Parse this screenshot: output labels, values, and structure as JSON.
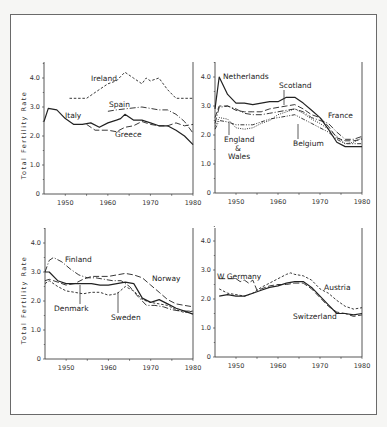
{
  "chart_data": [
    {
      "type": "line",
      "panel": "top-left",
      "ylabel": "Total Fertility Rate",
      "xlim": [
        1945,
        1980
      ],
      "ylim": [
        0,
        4.5
      ],
      "xticks": [
        "1950",
        "1960",
        "1970",
        "1980"
      ],
      "yticks": [
        "0",
        "1.0",
        "2.0",
        "3.0",
        "4.0"
      ],
      "series": [
        {
          "name": "Ireland",
          "style": "dashed-short",
          "x": [
            1951,
            1955,
            1958,
            1960,
            1962,
            1964,
            1966,
            1968,
            1969,
            1970,
            1972,
            1974,
            1976,
            1978,
            1980
          ],
          "values": [
            3.3,
            3.3,
            3.6,
            3.8,
            3.9,
            4.2,
            4.0,
            3.8,
            4.0,
            3.9,
            4.0,
            3.6,
            3.3,
            3.3,
            3.3
          ]
        },
        {
          "name": "Spain",
          "style": "dash-dot",
          "x": [
            1960,
            1962,
            1965,
            1968,
            1970,
            1972,
            1974,
            1976,
            1978,
            1980
          ],
          "values": [
            2.85,
            2.9,
            2.95,
            3.0,
            2.95,
            2.9,
            2.9,
            2.75,
            2.5,
            2.1
          ]
        },
        {
          "name": "Italy",
          "style": "solid",
          "x": [
            1945,
            1946,
            1948,
            1950,
            1952,
            1954,
            1956,
            1958,
            1960,
            1962,
            1963,
            1964,
            1966,
            1968,
            1970,
            1972,
            1974,
            1976,
            1978,
            1980
          ],
          "values": [
            2.5,
            2.95,
            2.9,
            2.6,
            2.4,
            2.4,
            2.45,
            2.3,
            2.45,
            2.55,
            2.6,
            2.75,
            2.55,
            2.55,
            2.45,
            2.35,
            2.35,
            2.2,
            2.0,
            1.7
          ]
        },
        {
          "name": "Greece",
          "style": "dashed-long",
          "x": [
            1955,
            1957,
            1960,
            1962,
            1964,
            1966,
            1968,
            1970,
            1972,
            1974,
            1976,
            1978,
            1980
          ],
          "values": [
            2.4,
            2.2,
            2.2,
            2.15,
            2.3,
            2.35,
            2.5,
            2.4,
            2.35,
            2.35,
            2.45,
            2.35,
            2.4
          ]
        }
      ],
      "annotations": [
        "Ireland",
        "Spain",
        "Italy",
        "Greece"
      ]
    },
    {
      "type": "line",
      "panel": "top-right",
      "xlim": [
        1945,
        1980
      ],
      "ylim": [
        0,
        4.5
      ],
      "xticks": [
        "1950",
        "1960",
        "1970",
        "1980"
      ],
      "yticks": [
        "0",
        "1.0",
        "2.0",
        "3.0",
        "4.0"
      ],
      "series": [
        {
          "name": "Netherlands",
          "style": "solid",
          "x": [
            1945,
            1946,
            1948,
            1950,
            1952,
            1954,
            1956,
            1958,
            1960,
            1962,
            1964,
            1966,
            1968,
            1970,
            1972,
            1974,
            1976,
            1978,
            1980
          ],
          "values": [
            2.9,
            4.0,
            3.4,
            3.1,
            3.1,
            3.05,
            3.1,
            3.15,
            3.15,
            3.3,
            3.3,
            3.1,
            2.85,
            2.6,
            2.2,
            1.75,
            1.6,
            1.6,
            1.6
          ]
        },
        {
          "name": "Scotland",
          "style": "dashed-long",
          "x": [
            1945,
            1946,
            1948,
            1950,
            1952,
            1954,
            1956,
            1958,
            1960,
            1962,
            1964,
            1966,
            1968,
            1970,
            1972,
            1974,
            1976,
            1978,
            1980
          ],
          "values": [
            2.6,
            3.0,
            3.0,
            2.85,
            2.8,
            2.8,
            2.8,
            2.9,
            2.95,
            3.0,
            3.05,
            2.9,
            2.7,
            2.6,
            2.3,
            1.9,
            1.8,
            1.8,
            1.85
          ]
        },
        {
          "name": "France",
          "style": "dash-dot",
          "x": [
            1945,
            1946,
            1948,
            1950,
            1952,
            1954,
            1956,
            1958,
            1960,
            1962,
            1964,
            1966,
            1968,
            1970,
            1972,
            1974,
            1976,
            1978,
            1980
          ],
          "values": [
            2.4,
            2.95,
            3.0,
            2.9,
            2.75,
            2.7,
            2.7,
            2.75,
            2.8,
            2.85,
            2.9,
            2.8,
            2.6,
            2.5,
            2.4,
            2.1,
            1.85,
            1.85,
            1.95
          ]
        },
        {
          "name": "England & Wales",
          "style": "dotted",
          "x": [
            1945,
            1946,
            1948,
            1950,
            1952,
            1954,
            1956,
            1958,
            1960,
            1962,
            1964,
            1966,
            1968,
            1970,
            1972,
            1974,
            1976,
            1978,
            1980
          ],
          "values": [
            2.3,
            2.6,
            2.55,
            2.25,
            2.2,
            2.25,
            2.4,
            2.5,
            2.7,
            2.8,
            2.9,
            2.75,
            2.55,
            2.4,
            2.2,
            1.95,
            1.7,
            1.75,
            1.9
          ]
        },
        {
          "name": "Belgium",
          "style": "dash-dot-dot",
          "x": [
            1945,
            1946,
            1948,
            1950,
            1952,
            1954,
            1956,
            1958,
            1960,
            1962,
            1964,
            1966,
            1968,
            1970,
            1972,
            1974,
            1976,
            1978,
            1980
          ],
          "values": [
            2.2,
            2.5,
            2.45,
            2.35,
            2.35,
            2.35,
            2.45,
            2.55,
            2.6,
            2.65,
            2.7,
            2.55,
            2.4,
            2.25,
            2.1,
            1.85,
            1.7,
            1.7,
            1.7
          ]
        }
      ],
      "annotations": [
        "Netherlands",
        "Scotland",
        "France",
        "England",
        "&",
        "Wales",
        "Belgium"
      ]
    },
    {
      "type": "line",
      "panel": "bottom-left",
      "ylabel": "Total Fertility Rate",
      "xlim": [
        1945,
        1980
      ],
      "ylim": [
        0,
        4.5
      ],
      "xticks": [
        "1950",
        "1960",
        "1970",
        "1980"
      ],
      "yticks": [
        "0",
        "1.0",
        "2.0",
        "3.0",
        "4.0"
      ],
      "series": [
        {
          "name": "Finland",
          "style": "dash-dot",
          "x": [
            1945,
            1946,
            1947,
            1949,
            1951,
            1953,
            1955,
            1957,
            1959,
            1961,
            1963,
            1965,
            1967,
            1969,
            1971,
            1973,
            1975,
            1977,
            1980
          ],
          "values": [
            3.0,
            3.4,
            3.5,
            3.35,
            3.1,
            2.9,
            2.8,
            2.8,
            2.75,
            2.7,
            2.7,
            2.5,
            2.15,
            1.85,
            1.85,
            1.8,
            1.7,
            1.65,
            1.65
          ]
        },
        {
          "name": "Norway",
          "style": "dashed-long",
          "x": [
            1945,
            1946,
            1948,
            1950,
            1952,
            1954,
            1956,
            1958,
            1960,
            1962,
            1964,
            1966,
            1968,
            1970,
            1972,
            1974,
            1976,
            1978,
            1980
          ],
          "values": [
            2.7,
            2.75,
            2.65,
            2.55,
            2.6,
            2.75,
            2.85,
            2.85,
            2.85,
            2.9,
            2.95,
            2.9,
            2.8,
            2.55,
            2.3,
            2.05,
            1.9,
            1.85,
            1.8
          ]
        },
        {
          "name": "Denmark",
          "style": "solid",
          "x": [
            1945,
            1946,
            1948,
            1950,
            1952,
            1954,
            1956,
            1958,
            1960,
            1962,
            1964,
            1966,
            1968,
            1970,
            1972,
            1974,
            1976,
            1978,
            1980
          ],
          "values": [
            3.0,
            3.0,
            2.7,
            2.6,
            2.6,
            2.6,
            2.6,
            2.55,
            2.55,
            2.6,
            2.65,
            2.6,
            2.1,
            1.95,
            2.05,
            1.9,
            1.75,
            1.65,
            1.55
          ]
        },
        {
          "name": "Sweden",
          "style": "dashed-short",
          "x": [
            1945,
            1946,
            1948,
            1950,
            1952,
            1954,
            1956,
            1958,
            1960,
            1962,
            1964,
            1966,
            1968,
            1970,
            1972,
            1974,
            1976,
            1978,
            1980
          ],
          "values": [
            2.6,
            2.7,
            2.5,
            2.35,
            2.3,
            2.25,
            2.3,
            2.3,
            2.2,
            2.25,
            2.5,
            2.35,
            2.05,
            1.95,
            1.9,
            1.85,
            1.7,
            1.6,
            1.65
          ]
        }
      ],
      "annotations": [
        "Finland",
        "Norway",
        "Denmark",
        "Sweden"
      ]
    },
    {
      "type": "line",
      "panel": "bottom-right",
      "xlim": [
        1945,
        1980
      ],
      "ylim": [
        0,
        4.5
      ],
      "xticks": [
        "1950",
        "1960",
        "1970",
        "1980"
      ],
      "yticks": [
        "0",
        "1.0",
        "2.0",
        "3.0",
        "4.0"
      ],
      "series": [
        {
          "name": "W Germany",
          "style": "dashed-long",
          "x": [
            1946,
            1948,
            1950,
            1951,
            1952,
            1953,
            1954,
            1955,
            1956,
            1958,
            1960,
            1962,
            1964,
            1966,
            1968,
            1970,
            1972,
            1974,
            1976,
            1978,
            1980
          ],
          "values": [
            2.7,
            2.7,
            2.7,
            2.6,
            2.65,
            2.55,
            2.65,
            2.3,
            2.35,
            2.45,
            2.5,
            2.5,
            2.55,
            2.55,
            2.35,
            2.05,
            1.75,
            1.55,
            1.5,
            1.4,
            1.45
          ]
        },
        {
          "name": "Austria",
          "style": "dashed-short",
          "x": [
            1946,
            1948,
            1950,
            1952,
            1954,
            1956,
            1958,
            1960,
            1962,
            1963,
            1964,
            1966,
            1968,
            1970,
            1972,
            1974,
            1976,
            1978,
            1980
          ],
          "values": [
            2.35,
            2.2,
            2.15,
            2.1,
            2.2,
            2.4,
            2.55,
            2.7,
            2.85,
            2.9,
            2.85,
            2.8,
            2.65,
            2.35,
            2.2,
            1.95,
            1.75,
            1.65,
            1.7
          ]
        },
        {
          "name": "Switzerland",
          "style": "solid",
          "x": [
            1946,
            1948,
            1950,
            1952,
            1954,
            1956,
            1958,
            1960,
            1962,
            1964,
            1966,
            1968,
            1970,
            1972,
            1974,
            1976,
            1978,
            1980
          ],
          "values": [
            2.1,
            2.15,
            2.1,
            2.1,
            2.2,
            2.3,
            2.4,
            2.45,
            2.55,
            2.6,
            2.6,
            2.4,
            2.1,
            1.8,
            1.5,
            1.5,
            1.45,
            1.5
          ]
        }
      ],
      "annotations": [
        "W Germany",
        "Austria",
        "Switzerland"
      ]
    }
  ],
  "labels": {
    "ireland": "Ireland",
    "spain": "Spain",
    "italy": "Italy",
    "greece": "Greece",
    "netherlands": "Netherlands",
    "scotland": "Scotland",
    "france": "France",
    "england": "England",
    "amp": "&",
    "wales": "Wales",
    "belgium": "Belgium",
    "finland": "Finland",
    "norway": "Norway",
    "denmark": "Denmark",
    "sweden": "Sweden",
    "wgermany": "W Germany",
    "austria": "Austria",
    "switzerland": "Switzerland",
    "ylabel": "Total Fertility Rate"
  }
}
